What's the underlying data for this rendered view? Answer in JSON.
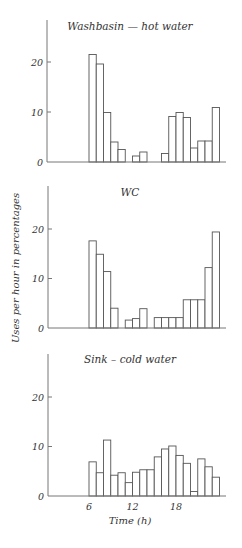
{
  "figure": {
    "ylabel": "Uses per hour in percentages",
    "xlabel": "Time (h)"
  },
  "chart_data": [
    {
      "type": "bar",
      "title": "Washbasin — hot water",
      "xlabel": "",
      "ylabel": "Uses per hour in percentages",
      "ylim": [
        0,
        28
      ],
      "yticks": [
        0,
        10,
        20
      ],
      "xlim": [
        0,
        24
      ],
      "xticks": [],
      "grid": false,
      "bars": [
        {
          "hour": 6,
          "value": 21.5
        },
        {
          "hour": 7,
          "value": 19.6
        },
        {
          "hour": 8,
          "value": 9.9
        },
        {
          "hour": 9,
          "value": 4.0
        },
        {
          "hour": 10,
          "value": 2.5
        },
        {
          "hour": 12,
          "value": 1.2
        },
        {
          "hour": 13,
          "value": 2.0
        },
        {
          "hour": 16,
          "value": 1.7
        },
        {
          "hour": 17,
          "value": 9.1
        },
        {
          "hour": 18,
          "value": 9.9
        },
        {
          "hour": 19,
          "value": 8.9
        },
        {
          "hour": 20,
          "value": 2.8
        },
        {
          "hour": 21,
          "value": 4.2
        },
        {
          "hour": 22,
          "value": 4.2
        },
        {
          "hour": 23,
          "value": 10.9
        }
      ]
    },
    {
      "type": "bar",
      "title": "WC",
      "xlabel": "",
      "ylabel": "Uses per hour in percentages",
      "ylim": [
        0,
        28
      ],
      "yticks": [
        0,
        10,
        20
      ],
      "xlim": [
        0,
        24
      ],
      "xticks": [],
      "grid": false,
      "bars": [
        {
          "hour": 6,
          "value": 17.6
        },
        {
          "hour": 7,
          "value": 14.9
        },
        {
          "hour": 8,
          "value": 11.4
        },
        {
          "hour": 9,
          "value": 4.0
        },
        {
          "hour": 11,
          "value": 1.6
        },
        {
          "hour": 12,
          "value": 1.9
        },
        {
          "hour": 13,
          "value": 3.9
        },
        {
          "hour": 15,
          "value": 2.1
        },
        {
          "hour": 16,
          "value": 2.1
        },
        {
          "hour": 17,
          "value": 2.1
        },
        {
          "hour": 18,
          "value": 2.1
        },
        {
          "hour": 19,
          "value": 5.7
        },
        {
          "hour": 20,
          "value": 5.7
        },
        {
          "hour": 21,
          "value": 5.7
        },
        {
          "hour": 22,
          "value": 12.2
        },
        {
          "hour": 23,
          "value": 19.4
        }
      ]
    },
    {
      "type": "bar",
      "title": "Sink – cold water",
      "xlabel": "Time (h)",
      "ylabel": "Uses per hour in percentages",
      "ylim": [
        0,
        26
      ],
      "yticks": [
        0,
        10,
        20
      ],
      "xlim": [
        0,
        24
      ],
      "xticks": [
        6,
        12,
        18
      ],
      "grid": false,
      "bars": [
        {
          "hour": 6,
          "value": 6.9
        },
        {
          "hour": 7,
          "value": 4.7
        },
        {
          "hour": 8,
          "value": 11.3
        },
        {
          "hour": 9,
          "value": 4.2
        },
        {
          "hour": 10,
          "value": 4.7
        },
        {
          "hour": 11,
          "value": 2.7
        },
        {
          "hour": 12,
          "value": 4.8
        },
        {
          "hour": 13,
          "value": 5.3
        },
        {
          "hour": 14,
          "value": 5.3
        },
        {
          "hour": 15,
          "value": 7.9
        },
        {
          "hour": 16,
          "value": 9.5
        },
        {
          "hour": 17,
          "value": 10.1
        },
        {
          "hour": 18,
          "value": 8.2
        },
        {
          "hour": 19,
          "value": 6.6
        },
        {
          "hour": 20,
          "value": 0.9
        },
        {
          "hour": 21,
          "value": 7.5
        },
        {
          "hour": 22,
          "value": 5.9
        },
        {
          "hour": 23,
          "value": 3.8
        }
      ]
    }
  ]
}
